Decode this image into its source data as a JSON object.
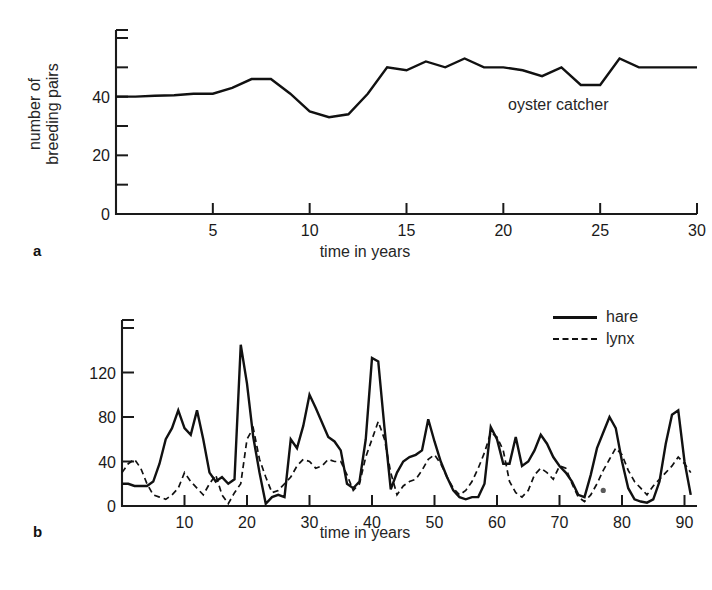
{
  "figure": {
    "panel_a_label": "a",
    "panel_b_label": "b"
  },
  "chart_data": [
    {
      "type": "line",
      "panel": "a",
      "title": "",
      "annotation": "oyster catcher",
      "xlabel": "time in years",
      "ylabel": "number of breeding pairs",
      "ylabel_lines": [
        "number of",
        "breeding pairs"
      ],
      "xlim": [
        0,
        30
      ],
      "ylim": [
        0,
        60
      ],
      "xticks": [
        5,
        10,
        15,
        20,
        25,
        30
      ],
      "xticklabels": [
        "5",
        "10",
        "15",
        "20",
        "25",
        "30"
      ],
      "yticks": [
        0,
        10,
        20,
        30,
        40,
        50,
        60
      ],
      "yticklabels": [
        "0",
        "",
        "20",
        "",
        "40",
        "",
        ""
      ],
      "grid": false,
      "legend": "none",
      "series": [
        {
          "name": "oyster catcher",
          "style": "solid",
          "x": [
            0,
            1,
            2,
            3,
            4,
            5,
            6,
            7,
            8,
            9,
            10,
            11,
            12,
            13,
            14,
            15,
            16,
            17,
            18,
            19,
            20,
            21,
            22,
            23,
            24,
            25,
            26,
            27,
            28,
            29,
            30
          ],
          "values": [
            40,
            40,
            40.3,
            40.5,
            41,
            41,
            43,
            46,
            46,
            41,
            35,
            33,
            34,
            41,
            50,
            49,
            52,
            50,
            53,
            50,
            50,
            49,
            47,
            50,
            44,
            44,
            53,
            50,
            50,
            50,
            50
          ]
        }
      ]
    },
    {
      "type": "line",
      "panel": "b",
      "title": "",
      "xlabel": "time in years",
      "ylabel": "thousands of individuals",
      "ylabel_lines": [
        "thousands of",
        "individuals"
      ],
      "xlim": [
        0,
        92
      ],
      "ylim": [
        0,
        160
      ],
      "xticks": [
        10,
        20,
        30,
        40,
        50,
        60,
        70,
        80,
        90
      ],
      "xticklabels": [
        "10",
        "20",
        "30",
        "40",
        "50",
        "60",
        "70",
        "80",
        "90"
      ],
      "yticks": [
        0,
        40,
        80,
        120,
        160
      ],
      "yticklabels": [
        "0",
        "40",
        "80",
        "120",
        ""
      ],
      "grid": false,
      "legend": "top-right",
      "legend_entries": [
        {
          "label": "hare",
          "style": "solid"
        },
        {
          "label": "lynx",
          "style": "dashed"
        }
      ],
      "series": [
        {
          "name": "hare",
          "style": "solid",
          "x": [
            0,
            1,
            2,
            3,
            4,
            5,
            6,
            7,
            8,
            9,
            10,
            11,
            12,
            13,
            14,
            15,
            16,
            17,
            18,
            19,
            20,
            21,
            22,
            23,
            24,
            25,
            26,
            27,
            28,
            29,
            30,
            31,
            32,
            33,
            34,
            35,
            36,
            37,
            38,
            39,
            40,
            41,
            42,
            43,
            44,
            45,
            46,
            47,
            48,
            49,
            50,
            51,
            52,
            53,
            54,
            55,
            56,
            57,
            58,
            59,
            60,
            61,
            62,
            63,
            64,
            65,
            66,
            67,
            68,
            69,
            70,
            71,
            72,
            73,
            74,
            75,
            76,
            77,
            78,
            79,
            80,
            81,
            82,
            83,
            84,
            85,
            86,
            87,
            88,
            89,
            90,
            91
          ],
          "values": [
            20,
            20,
            18,
            18,
            18,
            22,
            38,
            60,
            70,
            86,
            70,
            64,
            86,
            60,
            30,
            22,
            26,
            20,
            24,
            145,
            110,
            62,
            30,
            2,
            8,
            10,
            8,
            60,
            52,
            72,
            100,
            88,
            75,
            62,
            58,
            50,
            20,
            16,
            22,
            60,
            133,
            130,
            70,
            15,
            30,
            40,
            44,
            46,
            50,
            78,
            58,
            40,
            26,
            14,
            8,
            6,
            8,
            8,
            20,
            71,
            60,
            38,
            38,
            62,
            36,
            40,
            50,
            64,
            56,
            44,
            36,
            30,
            22,
            10,
            8,
            28,
            52,
            66,
            80,
            70,
            40,
            16,
            6,
            4,
            3,
            6,
            22,
            56,
            82,
            86,
            40,
            10
          ]
        },
        {
          "name": "lynx",
          "style": "dashed",
          "x": [
            0,
            1,
            2,
            3,
            4,
            5,
            6,
            7,
            8,
            9,
            10,
            11,
            12,
            13,
            14,
            15,
            16,
            17,
            18,
            19,
            20,
            21,
            22,
            23,
            24,
            25,
            26,
            27,
            28,
            29,
            30,
            31,
            32,
            33,
            34,
            35,
            36,
            37,
            38,
            39,
            40,
            41,
            42,
            43,
            44,
            45,
            46,
            47,
            48,
            49,
            50,
            51,
            52,
            53,
            54,
            55,
            56,
            57,
            58,
            59,
            60,
            61,
            62,
            63,
            64,
            65,
            66,
            67,
            68,
            69,
            70,
            71,
            72,
            73,
            74,
            75,
            76,
            77,
            78,
            79,
            80,
            81,
            82,
            83,
            84,
            85,
            86,
            87,
            88,
            89,
            90,
            91
          ],
          "values": [
            30,
            38,
            42,
            34,
            20,
            10,
            8,
            6,
            10,
            16,
            30,
            22,
            16,
            10,
            20,
            28,
            10,
            2,
            12,
            20,
            60,
            70,
            42,
            26,
            12,
            14,
            20,
            26,
            36,
            42,
            40,
            34,
            36,
            42,
            40,
            40,
            28,
            14,
            20,
            44,
            60,
            76,
            60,
            30,
            10,
            18,
            22,
            24,
            32,
            42,
            46,
            38,
            26,
            16,
            10,
            14,
            22,
            34,
            48,
            66,
            62,
            50,
            22,
            12,
            8,
            14,
            28,
            34,
            30,
            24,
            36,
            34,
            20,
            8,
            4,
            10,
            20,
            32,
            42,
            52,
            46,
            32,
            22,
            16,
            10,
            18,
            24,
            30,
            36,
            44,
            38,
            30
          ]
        }
      ],
      "marks": [
        {
          "name": "scan-speck",
          "x": 77,
          "y": 14
        }
      ]
    }
  ]
}
